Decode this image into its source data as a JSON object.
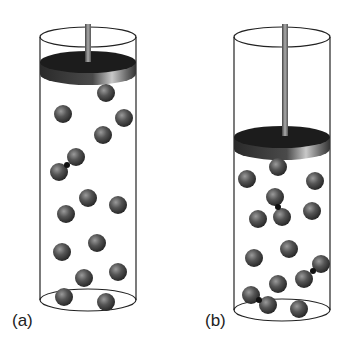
{
  "figure": {
    "panels": [
      {
        "label": "(a)",
        "description": "Gas-filled cylinder with piston raised (larger volume)",
        "piston_y": 62,
        "molecules": [
          [
            106,
            93
          ],
          [
            63,
            114
          ],
          [
            124,
            118
          ],
          [
            103,
            135
          ],
          [
            88,
            198
          ],
          [
            118,
            205
          ],
          [
            66,
            214
          ],
          [
            97,
            243
          ],
          [
            62,
            252
          ],
          [
            84,
            278
          ],
          [
            118,
            272
          ],
          [
            64,
            297
          ],
          [
            106,
            302
          ]
        ],
        "bonded_pairs": [
          [
            [
              76,
              157
            ],
            [
              59,
              172
            ]
          ]
        ]
      },
      {
        "label": "(b)",
        "description": "Gas-filled cylinder with piston pushed down (compressed, smaller volume)",
        "piston_y": 137,
        "molecules": [
          [
            278,
            167
          ],
          [
            247,
            179
          ],
          [
            315,
            181
          ],
          [
            312,
            211
          ],
          [
            258,
            219
          ],
          [
            289,
            249
          ],
          [
            254,
            258
          ],
          [
            278,
            284
          ],
          [
            299,
            309
          ]
        ],
        "bonded_pairs": [
          [
            [
              275,
              197
            ],
            [
              282,
              217
            ]
          ],
          [
            [
              321,
              264
            ],
            [
              304,
              279
            ]
          ],
          [
            [
              251,
              295
            ],
            [
              268,
              305
            ]
          ]
        ]
      }
    ],
    "colors": {
      "molecule": "#4a4a4a",
      "piston_top": "#1c1c1c",
      "piston_rim": "#555555",
      "outline": "#222222"
    }
  }
}
